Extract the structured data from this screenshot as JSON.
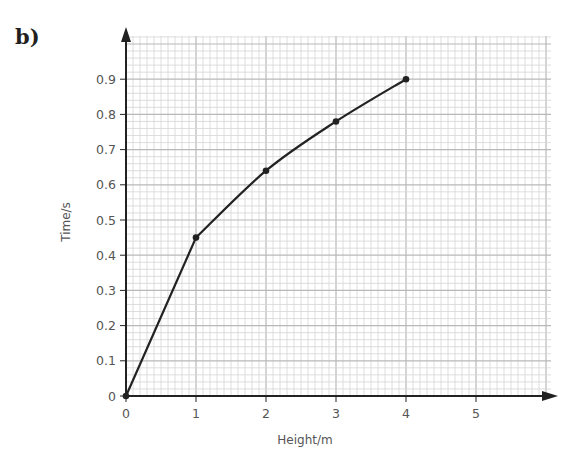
{
  "part_label": "b)",
  "chart_data": {
    "type": "line",
    "title": "",
    "xlabel": "Height/m",
    "ylabel": "Time/s",
    "x": [
      0,
      1,
      2,
      3,
      4
    ],
    "series": [
      {
        "name": "Time vs Height",
        "values": [
          0,
          0.45,
          0.64,
          0.78,
          0.9
        ]
      }
    ],
    "x_ticks": [
      "0",
      "1",
      "2",
      "3",
      "4",
      "5"
    ],
    "y_ticks": [
      "0",
      "0.1",
      "0.2",
      "0.3",
      "0.4",
      "0.5",
      "0.6",
      "0.7",
      "0.8",
      "0.9"
    ],
    "xlim": [
      0,
      6
    ],
    "ylim": [
      0,
      1.0
    ],
    "grid": true,
    "legend": "none",
    "colors": {
      "line": "#222222",
      "grid_minor": "#d6d6d6",
      "grid_major": "#b8b8b8",
      "axis": "#222222"
    }
  }
}
